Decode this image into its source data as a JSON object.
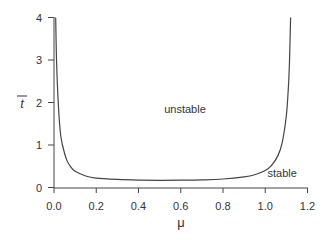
{
  "chart_data": {
    "type": "line",
    "title": "",
    "xlabel": "μ",
    "ylabel": "t̄",
    "xlim": [
      0.0,
      1.2
    ],
    "ylim": [
      0,
      4
    ],
    "xticks": [
      "0.0",
      "0.2",
      "0.4",
      "0.6",
      "0.8",
      "1.0",
      "1.2"
    ],
    "yticks": [
      "0",
      "1",
      "2",
      "3",
      "4"
    ],
    "grid": false,
    "legend": null,
    "annotations": [
      {
        "text": "unstable",
        "x": 0.62,
        "y": 1.75
      },
      {
        "text": "stable",
        "x": 1.08,
        "y": 0.25
      }
    ],
    "series": [
      {
        "name": "stability boundary",
        "x": [
          0.008,
          0.012,
          0.02,
          0.03,
          0.04,
          0.06,
          0.08,
          0.1,
          0.15,
          0.2,
          0.3,
          0.4,
          0.5,
          0.6,
          0.7,
          0.8,
          0.9,
          0.95,
          1.0,
          1.03,
          1.06,
          1.08,
          1.1,
          1.11,
          1.115,
          1.12
        ],
        "y": [
          4.0,
          3.0,
          2.0,
          1.3,
          1.0,
          0.65,
          0.48,
          0.38,
          0.27,
          0.22,
          0.19,
          0.175,
          0.17,
          0.172,
          0.18,
          0.2,
          0.25,
          0.3,
          0.4,
          0.52,
          0.75,
          1.05,
          1.7,
          2.4,
          3.0,
          4.0
        ]
      }
    ]
  }
}
